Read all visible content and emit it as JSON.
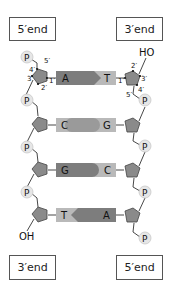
{
  "labels": {
    "top_left_end": "5′end",
    "top_right_end": "3′end",
    "bottom_left_end": "3′end",
    "bottom_right_end": "5′end",
    "hydroxyl_top_right": "HO",
    "hydroxyl_bottom_left": "OH",
    "phosphate": "P"
  },
  "carbon_labels_left": {
    "c1": "1′",
    "c2": "2′",
    "c3": "3′",
    "c4": "4′",
    "c5": "5′"
  },
  "carbon_labels_right": {
    "c1": "1′",
    "c2": "2′",
    "c3": "3′",
    "c4": "4′",
    "c5": "5′"
  },
  "base_pairs": [
    {
      "left": "A",
      "right": "T",
      "left_shape": "arrow-right"
    },
    {
      "left": "C",
      "right": "G",
      "left_shape": "round-right"
    },
    {
      "left": "G",
      "right": "C",
      "left_shape": "round-right"
    },
    {
      "left": "T",
      "right": "A",
      "left_shape": "arrow-left"
    }
  ],
  "colors": {
    "sugar": "#8a8a8a",
    "base_dark": "#7d7d7d",
    "base_light": "#b9b9b9",
    "phosphate_fill": "#e6e6e6",
    "phosphate_stroke": "#c8c8c8",
    "line": "#333333"
  }
}
